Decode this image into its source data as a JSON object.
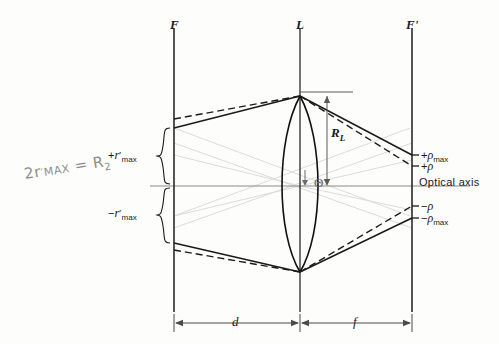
{
  "figure": {
    "background_color": "#fdfdfc",
    "ink_color": "#1a1a1a",
    "construction_color": "#d8d8d8",
    "axis_color": "#8a8a8a",
    "handwriting_color": "#8d8d8d"
  },
  "planes": {
    "front_focal": "F",
    "lens": "L",
    "back_focal": "F'"
  },
  "dimensions": {
    "object_distance": "d",
    "focal_length": "f",
    "lens_radius": "R",
    "lens_radius_sub": "L"
  },
  "left_labels": {
    "positive_r_max_sign": "+",
    "positive_r_max_sym": "r",
    "positive_r_max_sub": "max",
    "negative_r_max_sign": "−",
    "negative_r_max_sym": "r",
    "negative_r_max_sub": "max"
  },
  "right_labels": {
    "plus_rho_max_sign": "+",
    "plus_rho_max_sym": "ρ",
    "plus_rho_max_sub": "max",
    "plus_rho_sign": "+",
    "plus_rho_sym": "ρ",
    "optical_axis": "Optical axis",
    "minus_rho_sign": "−",
    "minus_rho_sym": "ρ",
    "minus_rho_max_sign": "−",
    "minus_rho_max_sym": "ρ",
    "minus_rho_max_sub": "max"
  },
  "angle": {
    "theta": "Θ"
  },
  "annotation": {
    "prefix": "2",
    "symbol": "r",
    "subscript": "MAX",
    "equals": "=",
    "result": "R",
    "result_sub": "2"
  }
}
